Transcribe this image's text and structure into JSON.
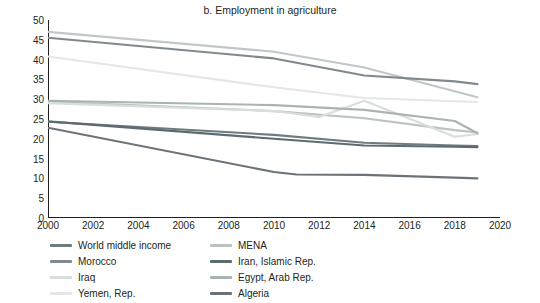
{
  "chart_data": {
    "type": "line",
    "title": "b. Employment in agriculture",
    "xlabel": "",
    "ylabel": "Percent of total employment",
    "xlim": [
      2000,
      2020
    ],
    "ylim": [
      0,
      50
    ],
    "xticks": [
      2000,
      2002,
      2004,
      2006,
      2008,
      2010,
      2012,
      2014,
      2016,
      2018,
      2020
    ],
    "yticks": [
      0,
      5,
      10,
      15,
      20,
      25,
      30,
      35,
      40,
      45,
      50
    ],
    "grid": false,
    "legend_position": "bottom",
    "series": [
      {
        "name": "World middle income",
        "color": "#6e7b7f",
        "x": [
          2000,
          2010,
          2014,
          2018,
          2019
        ],
        "values": [
          24.3,
          21.0,
          19.0,
          18.3,
          18.2
        ]
      },
      {
        "name": "MENA",
        "color": "#b9c3c2",
        "x": [
          2000,
          2010,
          2014,
          2018,
          2019
        ],
        "values": [
          29.4,
          27.0,
          25.2,
          22.2,
          21.6
        ]
      },
      {
        "name": "Morocco",
        "color": "#7f8a8e",
        "x": [
          2000,
          2010,
          2014,
          2018,
          2019
        ],
        "values": [
          45.5,
          40.3,
          36.0,
          34.5,
          33.8
        ]
      },
      {
        "name": "Iran, Islamic Rep.",
        "color": "#5c6b70",
        "x": [
          2000,
          2010,
          2014,
          2018,
          2019
        ],
        "values": [
          24.4,
          20.0,
          18.3,
          18.0,
          17.9
        ]
      },
      {
        "name": "Iraq",
        "color": "#d9dedd",
        "x": [
          2000,
          2010,
          2012,
          2014,
          2018,
          2019
        ],
        "values": [
          29.0,
          27.0,
          25.5,
          29.6,
          20.5,
          21.2
        ]
      },
      {
        "name": "Egypt, Arab Rep.",
        "color": "#a9b3b4",
        "x": [
          2000,
          2010,
          2014,
          2018,
          2019
        ],
        "values": [
          29.6,
          28.5,
          27.3,
          24.5,
          21.4
        ]
      },
      {
        "name": "Yemen, Rep.",
        "color": "#e3e7e6",
        "x": [
          2000,
          2010,
          2014,
          2018,
          2019
        ],
        "values": [
          40.8,
          33.0,
          30.3,
          29.5,
          29.3
        ]
      },
      {
        "name": "Algeria",
        "color": "#6b7378",
        "x": [
          2000,
          2010,
          2011,
          2014,
          2018,
          2019
        ],
        "values": [
          22.8,
          11.6,
          11.0,
          10.9,
          10.2,
          10.0
        ]
      }
    ],
    "extra_top_series": {
      "name": "Morocco-upper",
      "color": "#bfc8c7",
      "x": [
        2000,
        2010,
        2014,
        2019
      ],
      "values": [
        47.0,
        42.0,
        38.0,
        30.5
      ]
    }
  }
}
